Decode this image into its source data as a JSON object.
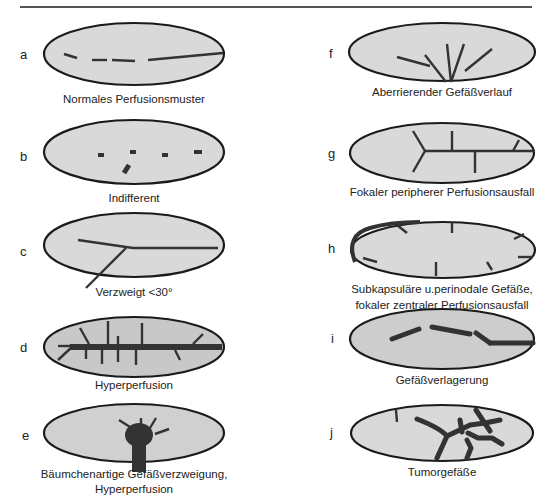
{
  "figure": {
    "panels": [
      {
        "letter": "a",
        "caption": "Normales Perfusionsmuster"
      },
      {
        "letter": "b",
        "caption": "Indifferent"
      },
      {
        "letter": "c",
        "caption": "Verzweigt <30°"
      },
      {
        "letter": "d",
        "caption": "Hyperperfusion"
      },
      {
        "letter": "e",
        "caption": "Bäumchenartige Gefäßverzweigung,",
        "caption2": "Hyperperfusion"
      },
      {
        "letter": "f",
        "caption": "Aberrierender Gefäßverlauf"
      },
      {
        "letter": "g",
        "caption": "Fokaler peripherer Perfusionsausfall"
      },
      {
        "letter": "h",
        "caption": "Subkapsuläre u.perinodale Gefäße,",
        "caption2": "fokaler zentraler Perfusionsausfall"
      },
      {
        "letter": "i",
        "caption": "Gefäßverlagerung"
      },
      {
        "letter": "j",
        "caption": "Tumorgefäße"
      }
    ],
    "colors": {
      "ellipse_fill": "#d9d9d9",
      "ellipse_stroke": "#1a1a1a",
      "vessel": "#333333"
    }
  }
}
